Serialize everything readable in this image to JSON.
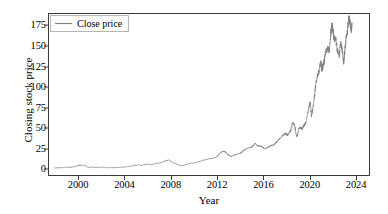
{
  "figure": {
    "background_color": "#ffffff",
    "frame_color": "#3a3a3a"
  },
  "legend": {
    "entries": [
      {
        "label": "Close price",
        "color": "#808080"
      }
    ],
    "position": "upper left"
  },
  "chart_data": {
    "type": "line",
    "title": "",
    "xlabel": "Year",
    "ylabel": "Closing stock price",
    "xlim": [
      1997.4,
      2025.2
    ],
    "ylim": [
      -8,
      190
    ],
    "xticks": [
      2000,
      2004,
      2008,
      2012,
      2016,
      2020,
      2024
    ],
    "xticklabels": [
      "2000",
      "2004",
      "2008",
      "2012",
      "2016",
      "2020",
      "2024"
    ],
    "yticks": [
      0,
      25,
      50,
      75,
      100,
      125,
      150,
      175
    ],
    "yticklabels": [
      "0",
      "25",
      "50",
      "75",
      "100",
      "125",
      "150",
      "175"
    ],
    "grid": false,
    "legend_position": "upper left",
    "series": [
      {
        "name": "Close price",
        "color": "#808080",
        "linewidth": 0.8,
        "x": [
          1997.9,
          1998.1,
          1998.3,
          1998.5,
          1998.7,
          1998.9,
          1999.1,
          1999.3,
          1999.5,
          1999.7,
          1999.9,
          2000.0,
          2000.1,
          2000.25,
          2000.4,
          2000.55,
          2000.7,
          2000.85,
          2001.0,
          2001.2,
          2001.4,
          2001.6,
          2001.8,
          2002.0,
          2002.2,
          2002.4,
          2002.6,
          2002.8,
          2003.0,
          2003.2,
          2003.4,
          2003.6,
          2003.8,
          2004.0,
          2004.2,
          2004.4,
          2004.6,
          2004.8,
          2005.0,
          2005.2,
          2005.4,
          2005.6,
          2005.8,
          2006.0,
          2006.2,
          2006.4,
          2006.6,
          2006.8,
          2007.0,
          2007.2,
          2007.4,
          2007.6,
          2007.8,
          2007.95,
          2008.1,
          2008.3,
          2008.5,
          2008.7,
          2008.85,
          2009.0,
          2009.2,
          2009.4,
          2009.6,
          2009.8,
          2010.0,
          2010.2,
          2010.4,
          2010.6,
          2010.8,
          2011.0,
          2011.2,
          2011.4,
          2011.6,
          2011.8,
          2012.0,
          2012.15,
          2012.3,
          2012.5,
          2012.7,
          2012.85,
          2013.0,
          2013.2,
          2013.4,
          2013.6,
          2013.8,
          2014.0,
          2014.1,
          2014.25,
          2014.4,
          2014.6,
          2014.8,
          2015.0,
          2015.15,
          2015.3,
          2015.5,
          2015.7,
          2015.9,
          2016.05,
          2016.2,
          2016.4,
          2016.6,
          2016.8,
          2017.0,
          2017.2,
          2017.4,
          2017.6,
          2017.8,
          2018.0,
          2018.1,
          2018.25,
          2018.4,
          2018.55,
          2018.7,
          2018.8,
          2018.9,
          2019.0,
          2019.1,
          2019.25,
          2019.4,
          2019.55,
          2019.7,
          2019.85,
          2020.0,
          2020.1,
          2020.2,
          2020.3,
          2020.45,
          2020.6,
          2020.75,
          2020.9,
          2021.0,
          2021.1,
          2021.2,
          2021.3,
          2021.45,
          2021.6,
          2021.75,
          2021.9,
          2022.0,
          2022.1,
          2022.2,
          2022.3,
          2022.45,
          2022.6,
          2022.75,
          2022.9,
          2023.0,
          2023.1,
          2023.2,
          2023.3,
          2023.45,
          2023.55,
          2023.65,
          2023.72
        ],
        "y": [
          0.5,
          0.6,
          0.9,
          0.8,
          1.1,
          1.3,
          1.5,
          1.7,
          2.0,
          2.6,
          3.3,
          3.9,
          4.5,
          3.8,
          4.3,
          3.6,
          2.0,
          1.3,
          1.5,
          1.8,
          1.5,
          1.3,
          1.2,
          1.5,
          1.4,
          1.0,
          0.9,
          1.1,
          1.0,
          1.1,
          1.3,
          1.5,
          1.7,
          1.9,
          2.2,
          2.6,
          3.1,
          3.8,
          4.2,
          4.5,
          4.0,
          4.4,
          5.0,
          5.5,
          4.8,
          5.2,
          5.8,
          6.3,
          6.8,
          7.5,
          8.6,
          9.8,
          10.5,
          9.2,
          7.5,
          6.2,
          5.5,
          4.2,
          3.5,
          3.6,
          4.3,
          5.2,
          6.0,
          6.6,
          7.0,
          7.6,
          8.2,
          9.0,
          10.2,
          10.8,
          11.6,
          12.0,
          12.5,
          13.0,
          14.5,
          17.0,
          19.2,
          21.5,
          20.5,
          18.0,
          16.5,
          14.8,
          15.6,
          17.0,
          18.0,
          18.5,
          19.5,
          21.5,
          23.0,
          24.5,
          25.5,
          26.5,
          28.0,
          31.0,
          28.0,
          27.5,
          27.0,
          25.0,
          24.0,
          26.0,
          27.5,
          28.5,
          30.0,
          33.0,
          36.5,
          38.5,
          42.0,
          43.0,
          41.0,
          44.0,
          46.5,
          56.0,
          55.0,
          48.0,
          39.5,
          41.0,
          49.0,
          50.5,
          49.0,
          53.0,
          56.0,
          66.0,
          77.0,
          81.0,
          64.0,
          72.0,
          88.0,
          106.0,
          115.0,
          122.0,
          132.0,
          122.0,
          126.0,
          131.0,
          144.0,
          148.0,
          146.0,
          170.0,
          178.0,
          166.0,
          158.0,
          160.0,
          146.0,
          138.0,
          156.0,
          143.0,
          130.0,
          145.0,
          160.0,
          166.0,
          186.0,
          178.0,
          172.0,
          175.0
        ]
      }
    ]
  },
  "axis": {
    "tick_color": "#3a3a3a",
    "text_color": "#000000"
  }
}
